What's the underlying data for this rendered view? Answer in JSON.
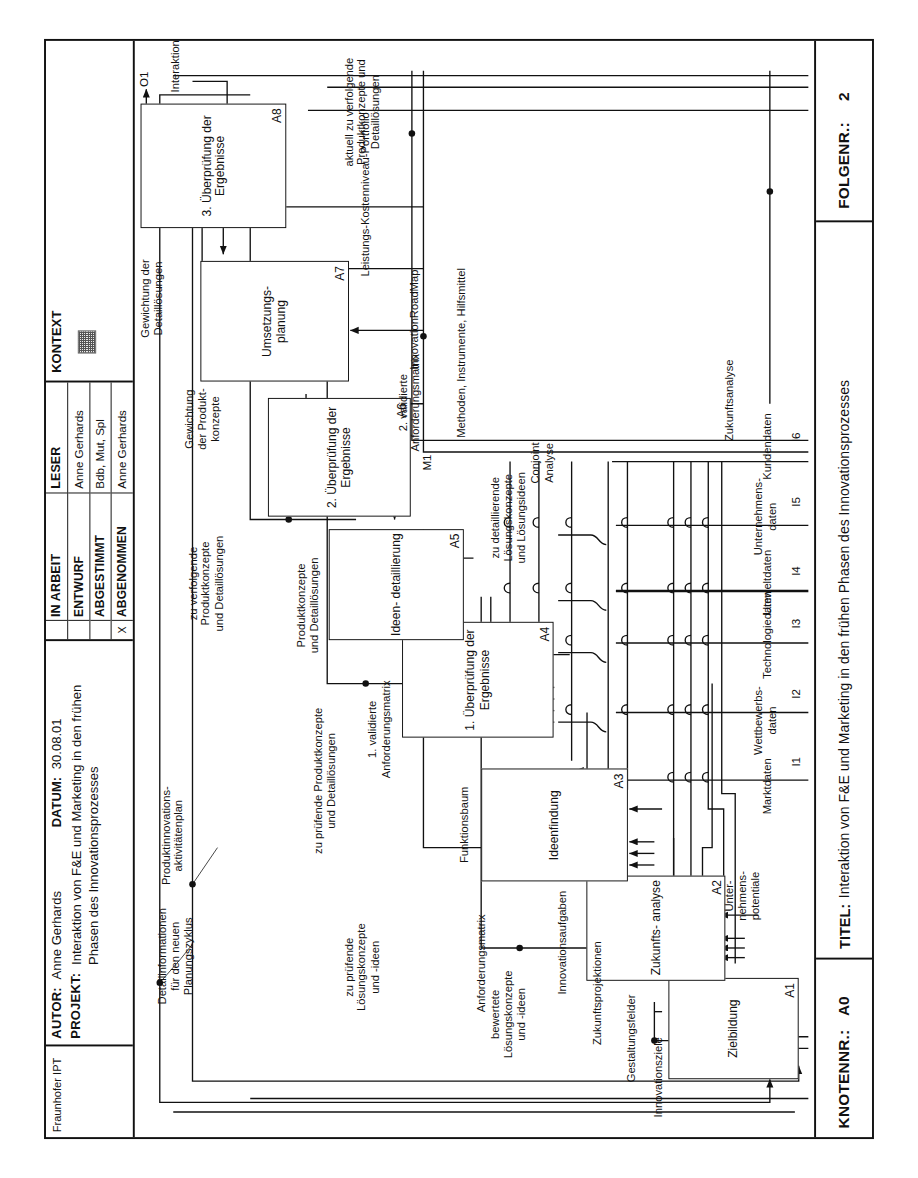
{
  "title_block": {
    "org": "Fraunhofer IPT",
    "author_key": "AUTOR:",
    "author_value": "Anne Gerhards",
    "date_key": "DATUM:",
    "date_value": "30.08.01",
    "project_key": "PROJEKT:",
    "project_value": "Interaktion von F&E und Marketing in den frühen Phasen des Innovationsprozesses",
    "status_header_left": "",
    "reader_header": "LESER",
    "context_header": "KONTEXT",
    "status_rows": [
      {
        "mark": "",
        "name": "IN ARBEIT",
        "reader": "Anne Gerhards"
      },
      {
        "mark": "",
        "name": "ENTWURF",
        "reader": "Bdb, Mut, Spl"
      },
      {
        "mark": "",
        "name": "ABGESTIMMT",
        "reader": "Anne Gerhards"
      },
      {
        "mark": "X",
        "name": "ABGENOMMEN",
        "reader": ""
      }
    ]
  },
  "footer": {
    "node_key": "KNOTENNR.:",
    "node_value": "A0",
    "title_key": "TITEL:",
    "title_value": "Interaktion von F&E und Marketing in den frühen Phasen des Innovationsprozesses",
    "seq_key": "FOLGENR.:",
    "seq_value": "2"
  },
  "diagram": {
    "type": "idef0",
    "activities": [
      {
        "id": "A1",
        "label": "Zielbildung"
      },
      {
        "id": "A2",
        "label": "Zukunfts-\nanalyse"
      },
      {
        "id": "A3",
        "label": "Ideenfindung"
      },
      {
        "id": "A4",
        "label": "1. Überprüfung\nder Ergebnisse"
      },
      {
        "id": "A5",
        "label": "Ideen-\ndetaillierung"
      },
      {
        "id": "A6",
        "label": "2. Überprüfung\nder Ergebnisse"
      },
      {
        "id": "A7",
        "label": "Umsetzungs-\nplanung"
      },
      {
        "id": "A8",
        "label": "3. Überprüfung\nder Ergebnisse"
      }
    ],
    "inputs": [
      {
        "code": "I1",
        "label": "Marktdaten"
      },
      {
        "code": "I2",
        "label": "Wettbewerbs-\ndaten"
      },
      {
        "code": "I3",
        "label": "Technologiedaten"
      },
      {
        "code": "I4",
        "label": "Umweltdaten"
      },
      {
        "code": "I5",
        "label": "Unternehmens-\ndaten"
      },
      {
        "code": "I6",
        "label": "Kundendaten"
      }
    ],
    "outputs": [
      {
        "code": "O1",
        "label": "Interaktionsplan"
      }
    ],
    "mechanisms": [
      {
        "code": "M1",
        "label": "Methoden, Instrumente, Hilfsmittel"
      }
    ],
    "flow_labels": [
      "Innovationsziele",
      "Gestaltungsfelder",
      "Zukunftsprojektionen",
      "Innovationsaufgaben",
      "bewertete\nLösungskonzepte\nund -ideen",
      "Anforderungsmatrix",
      "zu prüfende\nLösungskonzepte\nund -ideen",
      "Funktionsbaum",
      "1. validierte\nAnforderungsmatrix",
      "zu prüfende Produktkonzepte\nund Detaillösungen",
      "Produktkonzepte\nund Detaillösungen",
      "zu detaillierende\nLösungskonzepte\nund Lösungsideen",
      "2. validierte\nAnforderungsmatrix",
      "zu verfolgende\nProduktkonzepte\nund Detaillösungen",
      "Gewichtung\nder Produkt-\nkonzepte",
      "Gewichtung der\nDetaillösungen",
      "Produktinnovations-\naktivitätenplan",
      "Detailinformationen\nfür den neuen\nPlanungszyklus",
      "aktuell zu verfolgende\nProduktkonzepte und\nDetaillösungen",
      "Unter-\nnehmens-\npotentiale",
      "Conjoint\nAnalyse",
      "Zukunftsanalyse",
      "InnovationRoadMap",
      "Leistungs-Kostenniveau-Portfolio"
    ]
  }
}
